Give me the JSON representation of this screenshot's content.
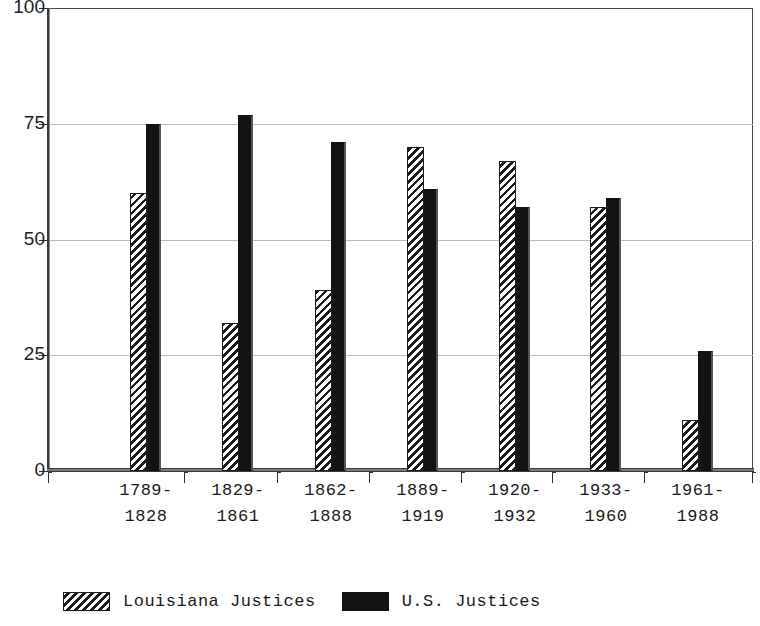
{
  "chart_data": {
    "type": "bar",
    "title": "",
    "subtitle": "",
    "xlabel": "",
    "ylabel": "",
    "grid": true,
    "legend_position": "bottom-left",
    "ylim": [
      0,
      100
    ],
    "yticks": [
      0,
      25,
      50,
      75,
      100
    ],
    "ytick_labels": [
      "0",
      "25",
      "50",
      "75",
      "100"
    ],
    "categories": [
      "1789-\n1828",
      "1829-\n1861",
      "1862-\n1888",
      "1889-\n1919",
      "1920-\n1932",
      "1933-\n1960",
      "1961-\n1988"
    ],
    "category_lines": [
      [
        "1789-",
        "1828"
      ],
      [
        "1829-",
        "1861"
      ],
      [
        "1862-",
        "1888"
      ],
      [
        "1889-",
        "1919"
      ],
      [
        "1920-",
        "1932"
      ],
      [
        "1933-",
        "1960"
      ],
      [
        "1961-",
        "1988"
      ]
    ],
    "series": [
      {
        "name": "Louisiana Justices",
        "pattern": "diagonal-hatch",
        "color": "#1c1c1c",
        "values": [
          60,
          32,
          39,
          70,
          67,
          57,
          11
        ]
      },
      {
        "name": "U.S. Justices",
        "pattern": "solid",
        "color": "#121212",
        "values": [
          75,
          77,
          71,
          61,
          57,
          59,
          26
        ]
      }
    ]
  },
  "legend": {
    "entries": [
      {
        "label": "Louisiana Justices",
        "swatch": "hatch-swatch"
      },
      {
        "label": "U.S. Justices",
        "swatch": "solid-swatch"
      }
    ]
  }
}
